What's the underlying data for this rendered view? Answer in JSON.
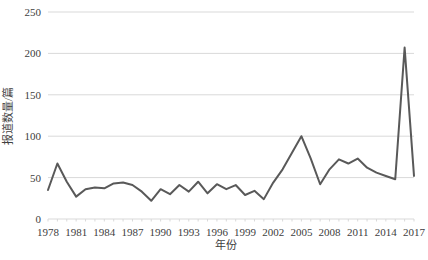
{
  "chart_data": {
    "type": "line",
    "title": "",
    "xlabel": "年份",
    "ylabel": "报道数量/篇",
    "ylim": [
      0,
      250
    ],
    "ytick_step": 50,
    "yticks": [
      0,
      50,
      100,
      150,
      200,
      250
    ],
    "xlim": [
      1978,
      2017
    ],
    "xtick_step": 3,
    "xticks": [
      1978,
      1981,
      1984,
      1987,
      1990,
      1993,
      1996,
      1999,
      2002,
      2005,
      2008,
      2011,
      2014,
      2017
    ],
    "grid": "horizontal",
    "legend": "none",
    "line_color": "#595959",
    "line_width": 2,
    "x": [
      1978,
      1979,
      1980,
      1981,
      1982,
      1983,
      1984,
      1985,
      1986,
      1987,
      1988,
      1989,
      1990,
      1991,
      1992,
      1993,
      1994,
      1995,
      1996,
      1997,
      1998,
      1999,
      2000,
      2001,
      2002,
      2003,
      2004,
      2005,
      2006,
      2007,
      2008,
      2009,
      2010,
      2011,
      2012,
      2013,
      2014,
      2015,
      2016,
      2017
    ],
    "values": [
      35,
      67,
      45,
      27,
      36,
      38,
      37,
      43,
      44,
      41,
      33,
      22,
      36,
      30,
      41,
      33,
      45,
      31,
      42,
      36,
      41,
      29,
      34,
      24,
      44,
      60,
      80,
      100,
      73,
      42,
      60,
      72,
      67,
      73,
      62,
      56,
      52,
      48,
      207,
      52
    ],
    "series": [
      {
        "name": "报道数量",
        "values": [
          35,
          67,
          45,
          27,
          36,
          38,
          37,
          43,
          44,
          41,
          33,
          22,
          36,
          30,
          41,
          33,
          45,
          31,
          42,
          36,
          41,
          29,
          34,
          24,
          44,
          60,
          80,
          100,
          73,
          42,
          60,
          72,
          67,
          73,
          62,
          56,
          52,
          48,
          207,
          52
        ]
      }
    ],
    "annotations": []
  },
  "axes": {
    "y_tick_labels": [
      "0",
      "50",
      "100",
      "150",
      "200",
      "250"
    ],
    "x_tick_labels": [
      "1978",
      "1981",
      "1984",
      "1987",
      "1990",
      "1993",
      "1996",
      "1999",
      "2002",
      "2005",
      "2008",
      "2011",
      "2014",
      "2017"
    ],
    "y_axis_title": "报道数量/篇",
    "x_axis_title": "年份"
  },
  "colors": {
    "line": "#595959",
    "grid": "#d9d9d9",
    "text": "#404040",
    "background": "#ffffff"
  }
}
